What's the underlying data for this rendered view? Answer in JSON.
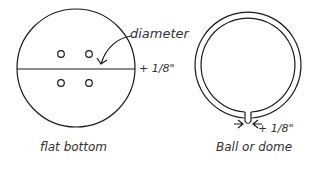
{
  "diagrams": [
    {
      "name": "flat-bottom",
      "caption": "flat bottom",
      "labels": {
        "diameter": "diameter",
        "allowance": "+ 1/8\""
      }
    },
    {
      "name": "ball-or-dome",
      "caption": "Ball or dome",
      "labels": {
        "allowance": "+ 1/8\""
      }
    }
  ],
  "colors": {
    "stroke": "#1a1a1a",
    "text": "#333333",
    "background": "#ffffff"
  }
}
